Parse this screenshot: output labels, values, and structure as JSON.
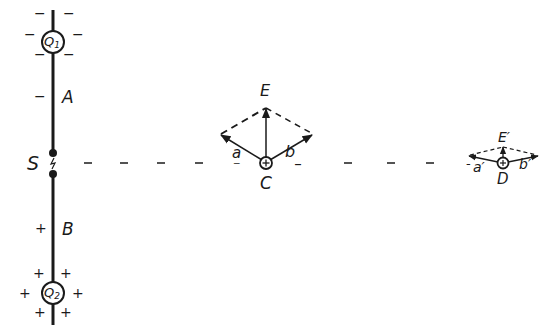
{
  "diagram": {
    "type": "electrostatics-field-vectors",
    "ink_color": "#1a1a1a",
    "background": "#ffffff",
    "conductor": {
      "charges": [
        {
          "id": "Q1",
          "symbol": "Q",
          "subscript": "1",
          "sign": "−"
        },
        {
          "id": "Q2",
          "symbol": "Q",
          "subscript": "2",
          "sign": "+"
        }
      ],
      "segments": [
        {
          "id": "A",
          "label": "A",
          "sign": "−"
        },
        {
          "id": "B",
          "label": "B",
          "sign": "+"
        }
      ],
      "spark_gap": {
        "label": "S",
        "glyph": "ϟ"
      }
    },
    "points": [
      {
        "id": "C",
        "label": "C",
        "marker": "⊕",
        "vectors": [
          {
            "id": "a",
            "label": "a",
            "mark": "_"
          },
          {
            "id": "b",
            "label": "b",
            "mark": "_"
          },
          {
            "id": "E",
            "label": "E",
            "mark": ""
          }
        ]
      },
      {
        "id": "D",
        "label": "D",
        "marker": "⊕",
        "vectors": [
          {
            "id": "a'",
            "label": "a′",
            "mark": "-"
          },
          {
            "id": "b'",
            "label": "b′",
            "mark": ""
          },
          {
            "id": "E'",
            "label": "E′",
            "mark": ""
          }
        ]
      }
    ]
  }
}
